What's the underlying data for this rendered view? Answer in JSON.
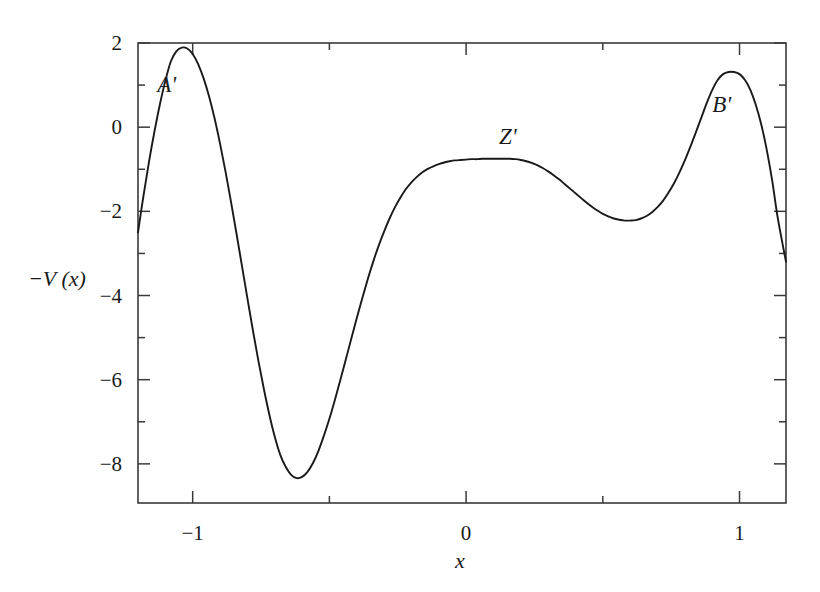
{
  "figure": {
    "background_color": "#ffffff",
    "curve_color": "#1a1a1a",
    "axis_color": "#3a3a3a"
  },
  "chart_data": {
    "type": "line",
    "title": "",
    "xlabel": "x",
    "ylabel": "-V (x)",
    "xlim": [
      -1.2,
      1.17
    ],
    "ylim": [
      -8.93,
      2.0
    ],
    "grid": false,
    "legend": null,
    "x_major_ticks": [
      -1,
      0,
      1
    ],
    "x_major_tick_labels": [
      "-1",
      "0",
      "1"
    ],
    "x_minor_ticks": [
      -0.5,
      0.5
    ],
    "y_major_ticks": [
      2,
      0,
      -2,
      -4,
      -6,
      -8
    ],
    "y_major_tick_labels": [
      "2",
      "0",
      "-2",
      "-4",
      "-6",
      "-8"
    ],
    "y_minor_ticks": [
      1,
      -1,
      -3,
      -5,
      -7
    ],
    "series": [
      {
        "name": "-V(x)",
        "x": [
          -1.2,
          -1.18,
          -1.16,
          -1.14,
          -1.12,
          -1.1,
          -1.08,
          -1.06,
          -1.04,
          -1.02,
          -1.0,
          -0.98,
          -0.96,
          -0.94,
          -0.92,
          -0.9,
          -0.88,
          -0.86,
          -0.84,
          -0.82,
          -0.8,
          -0.78,
          -0.76,
          -0.74,
          -0.72,
          -0.7,
          -0.68,
          -0.66,
          -0.64,
          -0.62,
          -0.6,
          -0.58,
          -0.56,
          -0.54,
          -0.52,
          -0.5,
          -0.48,
          -0.46,
          -0.44,
          -0.42,
          -0.4,
          -0.38,
          -0.36,
          -0.34,
          -0.32,
          -0.3,
          -0.28,
          -0.26,
          -0.24,
          -0.22,
          -0.2,
          -0.18,
          -0.16,
          -0.14,
          -0.12,
          -0.1,
          -0.08,
          -0.06,
          -0.04,
          -0.02,
          0.0,
          0.02,
          0.04,
          0.06,
          0.08,
          0.1,
          0.12,
          0.14,
          0.16,
          0.18,
          0.2,
          0.22,
          0.24,
          0.26,
          0.28,
          0.3,
          0.32,
          0.34,
          0.36,
          0.38,
          0.4,
          0.42,
          0.44,
          0.46,
          0.48,
          0.5,
          0.52,
          0.54,
          0.56,
          0.58,
          0.6,
          0.62,
          0.64,
          0.66,
          0.68,
          0.7,
          0.72,
          0.74,
          0.76,
          0.78,
          0.8,
          0.82,
          0.84,
          0.86,
          0.88,
          0.9,
          0.92,
          0.94,
          0.96,
          0.98,
          1.0,
          1.02,
          1.04,
          1.06,
          1.08,
          1.1,
          1.12,
          1.14,
          1.17
        ],
        "y": [
          -2.5,
          -1.63,
          -0.83,
          -0.11,
          0.54,
          1.1,
          1.56,
          1.8,
          1.89,
          1.87,
          1.74,
          1.5,
          1.16,
          0.73,
          0.21,
          -0.39,
          -1.05,
          -1.77,
          -2.52,
          -3.29,
          -4.06,
          -4.82,
          -5.54,
          -6.21,
          -6.82,
          -7.35,
          -7.78,
          -8.07,
          -8.26,
          -8.34,
          -8.31,
          -8.19,
          -7.98,
          -7.69,
          -7.33,
          -6.93,
          -6.48,
          -6.01,
          -5.52,
          -5.03,
          -4.54,
          -4.07,
          -3.62,
          -3.2,
          -2.82,
          -2.48,
          -2.17,
          -1.9,
          -1.67,
          -1.47,
          -1.31,
          -1.18,
          -1.07,
          -0.99,
          -0.93,
          -0.88,
          -0.84,
          -0.81,
          -0.79,
          -0.78,
          -0.77,
          -0.76,
          -0.76,
          -0.75,
          -0.75,
          -0.75,
          -0.75,
          -0.75,
          -0.75,
          -0.76,
          -0.78,
          -0.81,
          -0.85,
          -0.9,
          -0.97,
          -1.05,
          -1.14,
          -1.24,
          -1.35,
          -1.46,
          -1.57,
          -1.68,
          -1.79,
          -1.89,
          -1.98,
          -2.06,
          -2.12,
          -2.17,
          -2.2,
          -2.22,
          -2.22,
          -2.21,
          -2.17,
          -2.11,
          -2.02,
          -1.9,
          -1.75,
          -1.56,
          -1.34,
          -1.08,
          -0.79,
          -0.47,
          -0.13,
          0.22,
          0.57,
          0.88,
          1.12,
          1.26,
          1.31,
          1.31,
          1.26,
          1.12,
          0.88,
          0.52,
          0.05,
          -0.55,
          -1.29,
          -2.16,
          -3.2
        ]
      }
    ],
    "annotations": [
      {
        "text": "A'",
        "x": -1.095,
        "y": 1.02
      },
      {
        "text": "Z'",
        "x": 0.153,
        "y": -0.22
      },
      {
        "text": "B'",
        "x": 0.935,
        "y": 0.54
      }
    ]
  }
}
